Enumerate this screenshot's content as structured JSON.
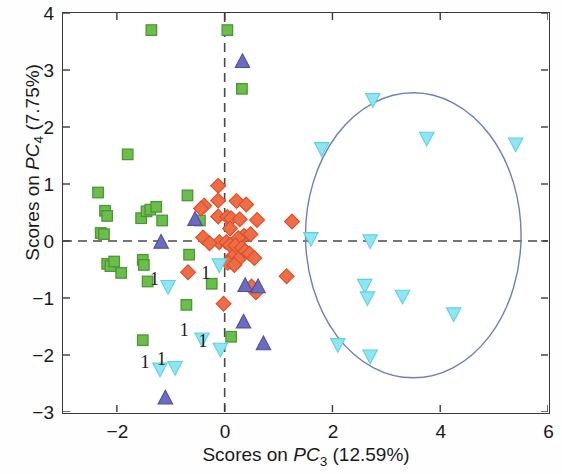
{
  "chart_data": {
    "type": "scatter",
    "title": "",
    "xlabel": "Scores on PC3 (12.59%)",
    "ylabel": "Scores on PC4 (7.75%)",
    "xlabel_parts": {
      "prefix": "Scores on ",
      "pc": "PC",
      "sub": "3",
      "suffix": " (12.59%)"
    },
    "ylabel_parts": {
      "prefix": "Scores on ",
      "pc": "PC",
      "sub": "4",
      "suffix": " (7.75%)"
    },
    "xlim": [
      -3,
      6
    ],
    "ylim": [
      -3,
      4
    ],
    "xticks": [
      -2,
      0,
      2,
      4,
      6
    ],
    "yticks": [
      4,
      3,
      2,
      1,
      0,
      -1,
      -2,
      -3
    ],
    "xtick_labels": [
      "−2",
      "0",
      "2",
      "4",
      "6"
    ],
    "ytick_labels": [
      "4",
      "3",
      "2",
      "1",
      "0",
      "−1",
      "−2",
      "−3"
    ],
    "grid": false,
    "legend": "none",
    "reference_lines": [
      {
        "name": "horizontal-zero-line",
        "axis": "y",
        "value": 0,
        "style": "dashed",
        "color": "#4a4a4a"
      },
      {
        "name": "vertical-zero-line",
        "axis": "x",
        "value": 0,
        "style": "dashed",
        "color": "#4a4a4a"
      }
    ],
    "ellipse": {
      "name": "confidence-ellipse",
      "cx": 3.5,
      "cy": 0.1,
      "rx": 2.0,
      "ry": 2.5,
      "color": "#6b7fbd",
      "fill": "none",
      "stroke_width": 1.4
    },
    "series": [
      {
        "name": "Class 1 (green squares)",
        "marker": "square",
        "color": "#6abf4b",
        "edge_color": "#4f9437",
        "points": [
          [
            -1.36,
            3.7
          ],
          [
            0.05,
            3.7
          ],
          [
            0.32,
            2.67
          ],
          [
            -1.8,
            1.52
          ],
          [
            -2.35,
            0.85
          ],
          [
            -0.69,
            0.8
          ],
          [
            -2.22,
            0.53
          ],
          [
            -2.18,
            0.44
          ],
          [
            -1.55,
            0.4
          ],
          [
            -1.45,
            0.52
          ],
          [
            -1.38,
            0.55
          ],
          [
            -1.27,
            0.6
          ],
          [
            -1.16,
            0.36
          ],
          [
            -0.46,
            0.36
          ],
          [
            -2.3,
            0.14
          ],
          [
            -2.24,
            0.12
          ],
          [
            -0.66,
            -0.24
          ],
          [
            -2.18,
            -0.4
          ],
          [
            -2.12,
            -0.44
          ],
          [
            -2.05,
            -0.36
          ],
          [
            -1.52,
            -0.33
          ],
          [
            -1.5,
            -0.42
          ],
          [
            -1.92,
            -0.56
          ],
          [
            -1.43,
            -0.71
          ],
          [
            -0.24,
            -0.75
          ],
          [
            -0.71,
            -1.12
          ],
          [
            -1.52,
            -1.74
          ],
          [
            0.12,
            -1.68
          ]
        ]
      },
      {
        "name": "Class 2 (orange diamonds)",
        "marker": "diamond",
        "color": "#ef6d46",
        "edge_color": "#d8522c",
        "points": [
          [
            -0.12,
            0.97
          ],
          [
            -0.12,
            0.71
          ],
          [
            0.22,
            0.7
          ],
          [
            -0.38,
            0.62
          ],
          [
            -0.44,
            0.57
          ],
          [
            0.4,
            0.64
          ],
          [
            -0.12,
            0.43
          ],
          [
            0.05,
            0.42
          ],
          [
            0.12,
            0.4
          ],
          [
            0.28,
            0.38
          ],
          [
            0.1,
            0.22
          ],
          [
            0.6,
            0.37
          ],
          [
            -0.4,
            0.06
          ],
          [
            0.36,
            0.09
          ],
          [
            0.25,
            0.05
          ],
          [
            0.48,
            0.12
          ],
          [
            1.25,
            0.34
          ],
          [
            -0.1,
            -0.02
          ],
          [
            0.03,
            -0.02
          ],
          [
            -0.28,
            -0.04
          ],
          [
            0.1,
            -0.07
          ],
          [
            0.2,
            -0.08
          ],
          [
            0.32,
            -0.12
          ],
          [
            0.38,
            -0.18
          ],
          [
            0.46,
            -0.22
          ],
          [
            0.14,
            -0.28
          ],
          [
            0.26,
            -0.32
          ],
          [
            0.55,
            -0.3
          ],
          [
            0.06,
            -0.38
          ],
          [
            0.18,
            -0.42
          ],
          [
            -0.68,
            -0.55
          ],
          [
            1.15,
            -0.62
          ],
          [
            0.5,
            -0.8
          ],
          [
            0.58,
            -0.9
          ],
          [
            -0.02,
            -1.1
          ]
        ]
      },
      {
        "name": "Class 3 (purple triangles)",
        "marker": "triangle-up",
        "color": "#6b6bbf",
        "edge_color": "#4f4f9e",
        "points": [
          [
            0.33,
            3.15
          ],
          [
            -0.55,
            0.38
          ],
          [
            -1.18,
            -0.02
          ],
          [
            0.38,
            -0.78
          ],
          [
            0.62,
            -0.8
          ],
          [
            0.35,
            -1.42
          ],
          [
            0.72,
            -1.8
          ],
          [
            -1.1,
            -2.75
          ]
        ]
      },
      {
        "name": "Class 4 (cyan down-triangles)",
        "marker": "triangle-down",
        "color": "#8de6f2",
        "edge_color": "#62cfe0",
        "points": [
          [
            2.75,
            2.48
          ],
          [
            3.75,
            1.8
          ],
          [
            1.8,
            1.62
          ],
          [
            5.4,
            1.7
          ],
          [
            1.6,
            0.04
          ],
          [
            2.7,
            0.0
          ],
          [
            -0.1,
            -0.42
          ],
          [
            -1.05,
            -0.8
          ],
          [
            2.6,
            -0.78
          ],
          [
            2.65,
            -1.0
          ],
          [
            3.3,
            -0.97
          ],
          [
            4.25,
            -1.28
          ],
          [
            -0.42,
            -1.72
          ],
          [
            -0.08,
            -1.9
          ],
          [
            2.1,
            -1.82
          ],
          [
            2.7,
            -2.02
          ],
          [
            -1.2,
            -2.25
          ],
          [
            -0.92,
            -2.22
          ]
        ]
      }
    ],
    "annotations": [
      {
        "text": "1",
        "x": -0.35,
        "y": -0.66
      },
      {
        "text": "1",
        "x": -1.3,
        "y": -0.78
      },
      {
        "text": "1",
        "x": -0.75,
        "y": -1.67
      },
      {
        "text": "1",
        "x": -0.4,
        "y": -1.86
      },
      {
        "text": "1",
        "x": -1.48,
        "y": -2.22
      },
      {
        "text": "1",
        "x": -1.17,
        "y": -2.18
      }
    ]
  }
}
